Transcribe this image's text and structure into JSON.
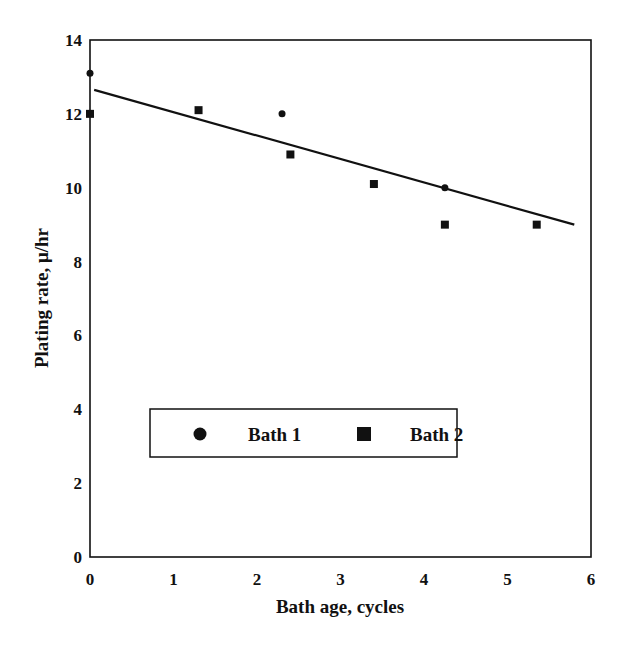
{
  "chart_data": {
    "type": "scatter",
    "title": "",
    "xlabel": "Bath age, cycles",
    "ylabel": "Plating rate, μ/hr",
    "xlim": [
      0,
      6
    ],
    "ylim": [
      0,
      14
    ],
    "x_ticks": [
      "0",
      "1",
      "2",
      "3",
      "4",
      "5",
      "6"
    ],
    "y_ticks": [
      "0",
      "2",
      "4",
      "6",
      "8",
      "10",
      "12",
      "14"
    ],
    "grid": false,
    "legend_position": "lower center inside plot",
    "series": [
      {
        "name": "Bath 1",
        "marker": "circle",
        "points": [
          {
            "x": 0.0,
            "y": 13.1
          },
          {
            "x": 2.3,
            "y": 12.0
          },
          {
            "x": 4.25,
            "y": 10.0
          }
        ]
      },
      {
        "name": "Bath 2",
        "marker": "square",
        "points": [
          {
            "x": 0.0,
            "y": 12.0
          },
          {
            "x": 1.3,
            "y": 12.1
          },
          {
            "x": 2.4,
            "y": 10.9
          },
          {
            "x": 3.4,
            "y": 10.1
          },
          {
            "x": 4.25,
            "y": 9.0
          },
          {
            "x": 5.35,
            "y": 9.0
          }
        ]
      }
    ],
    "trendline": {
      "name": "Linear fit",
      "start": {
        "x": 0.05,
        "y": 12.65
      },
      "end": {
        "x": 5.8,
        "y": 9.0
      }
    }
  },
  "legend": {
    "items": [
      {
        "label": "Bath 1",
        "marker": "circle"
      },
      {
        "label": "Bath 2",
        "marker": "square"
      }
    ]
  },
  "colors": {
    "ink": "#111111",
    "background": "#ffffff"
  }
}
